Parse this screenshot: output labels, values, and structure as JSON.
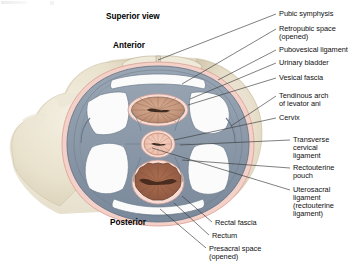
{
  "figure": {
    "title_text": "Superior view",
    "orientation_top": "Anterior",
    "orientation_bottom": "Posterior"
  },
  "labels": {
    "pubic_symphysis": "Pubic symphysis",
    "retropubic_space_1": "Retropubic space",
    "retropubic_space_2": "(opened)",
    "pubovesical_ligament": "Pubovesical ligament",
    "urinary_bladder": "Urinary bladder",
    "vesical_fascia": "Vesical fascia",
    "tendinous_arch_1": "Tendinous arch",
    "tendinous_arch_2": "of levator ani",
    "cervix": "Cervix",
    "transverse_cervical_1": "Transverse",
    "transverse_cervical_2": "cervical",
    "transverse_cervical_3": "ligament",
    "rectouterine_pouch_1": "Rectouterine",
    "rectouterine_pouch_2": "pouch",
    "uterosacral_1": "Uterosacral",
    "uterosacral_2": "ligament",
    "uterosacral_3": "(rectouterine",
    "uterosacral_4": "ligament)",
    "rectal_fascia": "Rectal fascia",
    "rectum": "Rectum",
    "presacral_space_1": "Presacral space",
    "presacral_space_2": "(opened)"
  },
  "colors": {
    "bone": "#e9e2cd",
    "bone_shadow": "#d6cdb4",
    "fascia_blue": "#8c99a8",
    "fascia_blue_dark": "#6c7a8a",
    "fascia_pink": "#f0c9c2",
    "bladder_tan": "#c89a82",
    "cervix_pink": "#f2c7b8",
    "rectum_brown": "#a0644a",
    "cavity_white": "#fbfbfb",
    "leader_line": "#3a3a3a",
    "text": "#111111"
  }
}
